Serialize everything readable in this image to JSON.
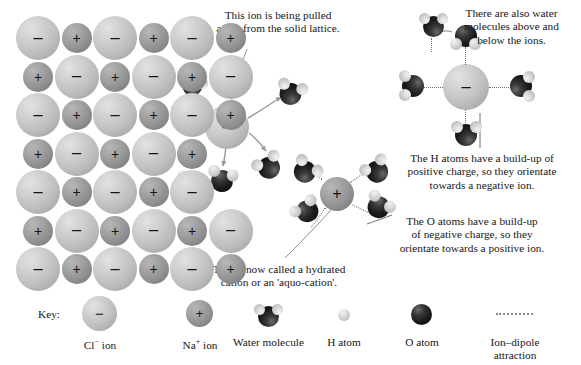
{
  "diagram": {
    "callouts": [
      {
        "id": "pulled-away",
        "lines": [
          "This ion is being pulled",
          "away from the solid lattice."
        ]
      },
      {
        "id": "above-below",
        "lines": [
          "There are also water",
          "molecules above and",
          "below the ions."
        ]
      },
      {
        "id": "h-atoms",
        "lines": [
          "The H atoms have a build-up of",
          "positive charge, so they orientate",
          "towards a negative ion."
        ]
      },
      {
        "id": "o-atoms",
        "lines": [
          "The O atoms have a build-up",
          "of negative charge, so they",
          "orientate towards a positive ion."
        ]
      },
      {
        "id": "hydrated-cation",
        "lines": [
          "This is now called a hydrated",
          "cation or an 'aquo-cation'."
        ]
      }
    ],
    "ion_signs": {
      "anion": "−",
      "cation": "+"
    },
    "lattice": {
      "rows": [
        [
          "-",
          "+",
          "-",
          "+",
          "-",
          "+"
        ],
        [
          "+",
          "-",
          "+",
          "-",
          "+",
          "-"
        ],
        [
          "-",
          "+",
          "-",
          "+",
          "-",
          "+"
        ],
        [
          "+",
          "-",
          "+",
          "-",
          "+",
          ""
        ],
        [
          "-",
          "+",
          "-",
          "+",
          "-",
          ""
        ],
        [
          "+",
          "-",
          "+",
          "-",
          "+",
          "-"
        ],
        [
          "-",
          "+",
          "-",
          "+",
          "-",
          "+"
        ]
      ]
    },
    "free_anion_sign": "−",
    "hydrated_cation_sign": "+",
    "hydrated_anion_sign": "−"
  },
  "key": {
    "title": "Key:",
    "items": [
      {
        "name": "chloride-ion",
        "label_html": "Cl<sup>−</sup> ion",
        "label": "Cl− ion"
      },
      {
        "name": "sodium-ion",
        "label_html": "Na<sup>+</sup> ion",
        "label": "Na+ ion"
      },
      {
        "name": "water-molecule",
        "label_html": "Water molecule",
        "label": "Water molecule"
      },
      {
        "name": "hydrogen-atom",
        "label_html": "H atom",
        "label": "H atom"
      },
      {
        "name": "oxygen-atom",
        "label_html": "O atom",
        "label": "O atom"
      },
      {
        "name": "ion-dipole",
        "label_html": "Ion–dipole<br>attraction",
        "label": "Ion–dipole attraction"
      }
    ]
  },
  "colors": {
    "anion": "#c6c6c6",
    "cation": "#959595",
    "oxygen": "#141414",
    "hydrogen": "#dcdcdc",
    "text": "#171717",
    "leader": "#8c8c8c",
    "background": "#ffffff"
  }
}
